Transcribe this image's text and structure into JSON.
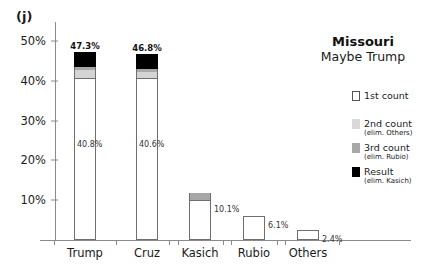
{
  "panel": {
    "label": "(j)"
  },
  "legend": {
    "title": "Missouri",
    "subtitle": "Maybe Trump",
    "items": [
      {
        "name": "1st count",
        "note": "",
        "swatch": "white",
        "color": "#ffffff"
      },
      {
        "name": "2nd count",
        "note": "(elim. Others)",
        "swatch": "light-gray",
        "color": "#d9d9d9"
      },
      {
        "name": "3rd count",
        "note": "(elim. Rubio)",
        "swatch": "medium-gray",
        "color": "#a8a8a8"
      },
      {
        "name": "Result",
        "note": "(elim. Kasich)",
        "swatch": "black",
        "color": "#000000"
      }
    ]
  },
  "chart_data": {
    "type": "bar",
    "title": "Missouri",
    "subtitle": "Maybe Trump",
    "xlabel": "",
    "ylabel": "",
    "ylim": [
      0,
      52
    ],
    "grid": false,
    "legend_position": "right",
    "categories": [
      "Trump",
      "Cruz",
      "Kasich",
      "Rubio",
      "Others"
    ],
    "ytick_labels": [
      "10%",
      "20%",
      "30%",
      "40%",
      "50%"
    ],
    "ytick_values": [
      10,
      20,
      30,
      40,
      50
    ],
    "series": [
      {
        "name": "1st count",
        "values": [
          40.8,
          40.6,
          10.1,
          6.1,
          2.4
        ]
      },
      {
        "name": "2nd count",
        "values": [
          42.6,
          42.3,
          10.1,
          0,
          0
        ]
      },
      {
        "name": "3rd count",
        "values": [
          43.4,
          43.0,
          11.9,
          0,
          0
        ]
      },
      {
        "name": "Result",
        "values": [
          47.3,
          46.8,
          0,
          0,
          0
        ]
      }
    ],
    "bar_top_labels": [
      "47.3%",
      "46.8%",
      "",
      "",
      ""
    ],
    "bar_value_labels": [
      "40.8%",
      "40.6%",
      "10.1%",
      "6.1%",
      "2.4%"
    ]
  }
}
